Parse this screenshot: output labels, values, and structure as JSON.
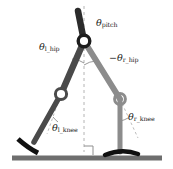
{
  "figure": {
    "name": "bipedal-robot-joint-angle-diagram",
    "background": "#ffffff",
    "width": 173,
    "height": 169
  },
  "colors": {
    "left_leg": "#4a4a4a",
    "right_leg": "#8c8c8c",
    "torso": "#2b2b2b",
    "foot": "#151515",
    "ground": "#6e6e6e",
    "dashed": "#b0b0b0",
    "label_text": "#1a1a1a"
  },
  "labels": {
    "pitch": {
      "symbol": "θ",
      "sub": "pitch",
      "sign": ""
    },
    "left_hip": {
      "symbol": "θ",
      "sub": "l_hip",
      "sign": ""
    },
    "right_hip": {
      "symbol": "θ",
      "sub": "r_hip",
      "sign": "−"
    },
    "left_knee": {
      "symbol": "θ",
      "sub": "l_knee",
      "sign": ""
    },
    "right_knee": {
      "symbol": "θ",
      "sub": "r_knee",
      "sign": ""
    }
  },
  "parts": {
    "torso": "torso-link",
    "hip_joint": "hip-joint",
    "left_thigh": "left-thigh-link",
    "left_knee_joint": "left-knee-joint",
    "left_shank": "left-shank-link",
    "left_foot": "left-foot",
    "right_thigh": "right-thigh-link",
    "right_knee_joint": "right-knee-joint",
    "right_shank": "right-shank-link",
    "right_foot": "right-foot",
    "ground": "ground-line",
    "vertical_reference": "vertical-dashed-reference",
    "right_angle_marker": "right-angle-marker"
  },
  "geometry": {
    "hip": [
      84,
      41
    ],
    "torso_top": [
      78,
      10
    ],
    "left_knee": [
      61,
      94
    ],
    "left_ankle": [
      34,
      142
    ],
    "right_knee": [
      120,
      99
    ],
    "right_ankle": [
      120,
      152
    ],
    "ground_y": 158,
    "ground_x0": 12,
    "ground_x1": 162
  }
}
